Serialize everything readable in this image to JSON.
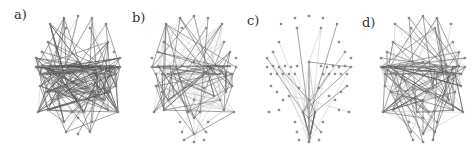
{
  "figure": {
    "panels": [
      {
        "id": "a",
        "label": "a)",
        "left": 0,
        "label_x": 14,
        "label_y": 7,
        "cx": 78,
        "density": 1.0,
        "light_ratio": 0.25,
        "seed": 11,
        "layout": "dense"
      },
      {
        "id": "b",
        "label": "b)",
        "left": 115,
        "label_x": 17,
        "label_y": 10,
        "cx": 79,
        "density": 0.55,
        "light_ratio": 0.45,
        "seed": 23,
        "layout": "clustered"
      },
      {
        "id": "c",
        "label": "c)",
        "left": 230,
        "label_x": 17,
        "label_y": 13,
        "cx": 79,
        "density": 0.35,
        "light_ratio": 0.7,
        "seed": 37,
        "layout": "hub"
      },
      {
        "id": "d",
        "label": "d)",
        "left": 355,
        "label_x": 7,
        "label_y": 15,
        "cx": 68,
        "density": 0.7,
        "light_ratio": 0.4,
        "seed": 51,
        "layout": "clustered"
      }
    ],
    "colors": {
      "edge_dark": "#555555",
      "edge_light": "#bbbbbb",
      "node_fill": "#9a9a9a",
      "label": "#333333"
    }
  }
}
